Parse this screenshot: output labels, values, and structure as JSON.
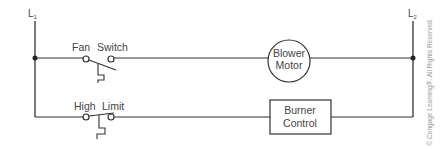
{
  "diagram": {
    "type": "ladder-wiring-diagram",
    "rails": {
      "left_label": "L",
      "left_sub": "1",
      "right_label": "L",
      "right_sub": "2"
    },
    "rungs": [
      {
        "switch_label_1": "Fan",
        "switch_label_2": "Switch",
        "switch_type": "normally-open",
        "load_label_1": "Blower",
        "load_label_2": "Motor",
        "load_shape": "circle"
      },
      {
        "switch_label_1": "High",
        "switch_label_2": "Limit",
        "switch_type": "normally-closed",
        "load_label_1": "Burner",
        "load_label_2": "Control",
        "load_shape": "rectangle"
      }
    ],
    "copyright": "© Cengage Learning®. All Rights Reserved."
  },
  "colors": {
    "line": "#333333",
    "text": "#444444",
    "copyright": "#999999"
  }
}
